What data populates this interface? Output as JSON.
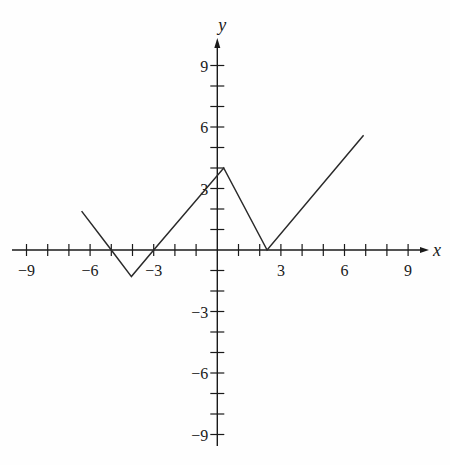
{
  "chart_data": {
    "type": "line",
    "title": "",
    "xlabel": "x",
    "ylabel": "y",
    "xlim": [
      -9.5,
      9.8
    ],
    "ylim": [
      -9.4,
      10.5
    ],
    "grid": false,
    "x_ticks": [
      -9,
      -8,
      -7,
      -6,
      -5,
      -4,
      -3,
      -2,
      -1,
      1,
      2,
      3,
      4,
      5,
      6,
      7,
      8,
      9
    ],
    "y_ticks": [
      -9,
      -8,
      -7,
      -6,
      -5,
      -4,
      -3,
      -2,
      -1,
      1,
      2,
      3,
      4,
      5,
      6,
      7,
      8,
      9
    ],
    "x_tick_labels": [
      {
        "value": -9,
        "label": "−9"
      },
      {
        "value": -6,
        "label": "−6"
      },
      {
        "value": -3,
        "label": "−3"
      },
      {
        "value": 3,
        "label": "3"
      },
      {
        "value": 6,
        "label": "6"
      },
      {
        "value": 9,
        "label": "9"
      }
    ],
    "y_tick_labels": [
      {
        "value": 9,
        "label": "9"
      },
      {
        "value": 6,
        "label": "6"
      },
      {
        "value": 3,
        "label": "3"
      },
      {
        "value": -3,
        "label": "−3"
      },
      {
        "value": -6,
        "label": "−6"
      },
      {
        "value": -9,
        "label": "−9"
      }
    ],
    "series": [
      {
        "name": "piecewise linear graph",
        "x": [
          -6.4,
          -5,
          -4.05,
          -3,
          0.3,
          2.35,
          6.9
        ],
        "y": [
          1.9,
          0,
          -1.3,
          0,
          4,
          0,
          5.6
        ]
      }
    ]
  },
  "colors": {
    "axis": "#1a1a1a",
    "line": "#2a2a2a",
    "background": "#fefefe"
  }
}
